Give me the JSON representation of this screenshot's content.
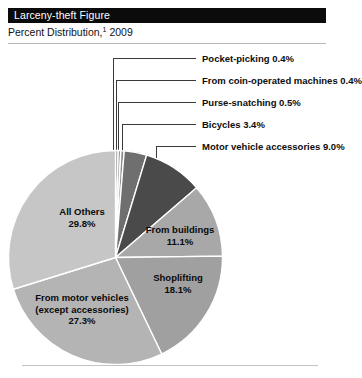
{
  "header": {
    "title": "Larceny-theft Figure",
    "subtitle_prefix": "Percent Distribution,",
    "subtitle_footnote": "1",
    "subtitle_year": "2009"
  },
  "colors": {
    "header_bar": "#0b0b0b",
    "header_text": "#ffffff",
    "rule": "#b9b9b9",
    "leader_line": "#3a3a3a",
    "slice_sep": "#ffffff",
    "slice_very_light": "#c9c9c9",
    "slice_light": "#bdbdbd",
    "slice_mid_light": "#b0b0b0",
    "slice_mid": "#a3a3a3",
    "slice_dark": "#4a4a4a",
    "slice_darkest": "#6a6a6a"
  },
  "chart_data": {
    "type": "pie",
    "title": "Larceny-theft Figure",
    "subtitle": "Percent Distribution, 1 2009",
    "unit": "percent",
    "total": 100.0,
    "start_angle_deg": 0,
    "direction": "clockwise",
    "legend_position": "callouts-right-and-inside",
    "categories": [
      "Pocket-picking",
      "From coin-operated machines",
      "Purse-snatching",
      "Bicycles",
      "Motor vehicle accessories",
      "From buildings",
      "Shoplifting",
      "From motor vehicles (except accessories)",
      "All Others"
    ],
    "values": [
      0.4,
      0.4,
      0.5,
      3.4,
      9.0,
      11.1,
      18.1,
      27.3,
      29.8
    ],
    "slices": [
      {
        "label": "Pocket-picking",
        "value": 0.4,
        "value_text": "0.4%",
        "label_text": "Pocket-picking 0.4%",
        "color": "#8f8f8f",
        "callout": true
      },
      {
        "label": "From coin-operated machines",
        "value": 0.4,
        "value_text": "0.4%",
        "label_text": "From coin-operated machines 0.4%",
        "color": "#9c9c9c",
        "callout": true
      },
      {
        "label": "Purse-snatching",
        "value": 0.5,
        "value_text": "0.5%",
        "label_text": "Purse-snatching 0.5%",
        "color": "#8a8a8a",
        "callout": true
      },
      {
        "label": "Bicycles",
        "value": 3.4,
        "value_text": "3.4%",
        "label_text": "Bicycles 3.4%",
        "color": "#6f6f6f",
        "callout": true
      },
      {
        "label": "Motor vehicle accessories",
        "value": 9.0,
        "value_text": "9.0%",
        "label_text": "Motor vehicle accessories 9.0%",
        "color": "#4a4a4a",
        "callout": true
      },
      {
        "label": "From buildings",
        "value": 11.1,
        "value_text": "11.1%",
        "label_text": "From buildings 11.1%",
        "color": "#a8a8a8",
        "callout": false
      },
      {
        "label": "Shoplifting",
        "value": 18.1,
        "value_text": "18.1%",
        "label_text": "Shoplifting 18.1%",
        "color": "#a0a0a0",
        "callout": false
      },
      {
        "label": "From motor vehicles (except accessories)",
        "value": 27.3,
        "value_text": "27.3%",
        "label_text": "From motor vehicles (except accessories) 27.3%",
        "color": "#b4b4b4",
        "callout": false
      },
      {
        "label": "All Others",
        "value": 29.8,
        "value_text": "29.8%",
        "label_text": "All Others 29.8%",
        "color": "#c6c6c6",
        "callout": false
      }
    ]
  },
  "callouts": [
    {
      "text": "Pocket-picking 0.4%"
    },
    {
      "text": "From coin-operated machines 0.4%"
    },
    {
      "text": "Purse-snatching 0.5%"
    },
    {
      "text": "Bicycles 3.4%"
    },
    {
      "text": "Motor vehicle accessories 9.0%"
    }
  ],
  "pie_labels": {
    "all_others": {
      "line1": "All Others",
      "line2": "29.8%"
    },
    "from_buildings": {
      "line1": "From buildings",
      "line2": "11.1%"
    },
    "shoplifting": {
      "line1": "Shoplifting",
      "line2": "18.1%"
    },
    "from_motor_vehicles": {
      "line1": "From motor vehicles",
      "line2": "(except accessories)",
      "line3": "27.3%"
    }
  }
}
